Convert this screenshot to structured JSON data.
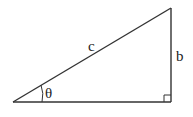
{
  "diagram": {
    "type": "right-triangle",
    "labels": {
      "hypotenuse": "c",
      "opposite": "b",
      "angle": "θ"
    },
    "vertices": {
      "angle_vertex": [
        13,
        102
      ],
      "top": [
        171,
        8
      ],
      "right_angle": [
        171,
        102
      ]
    },
    "stroke_color": "#333333",
    "background": "#ffffff"
  }
}
